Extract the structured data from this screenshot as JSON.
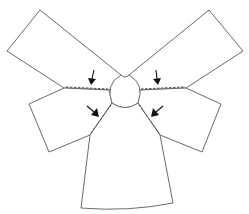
{
  "diagram": {
    "title": "",
    "pieces": [
      {
        "id": "top-left-panel",
        "label": ""
      },
      {
        "id": "top-right-panel",
        "label": ""
      },
      {
        "id": "middle-left-panel",
        "label": ""
      },
      {
        "id": "middle-right-panel",
        "label": ""
      },
      {
        "id": "bottom-panel",
        "label": ""
      },
      {
        "id": "center-head-piece",
        "label": ""
      }
    ],
    "seams": [
      {
        "id": "seam-top-left",
        "style": "dashed"
      },
      {
        "id": "seam-top-right",
        "style": "dashed"
      },
      {
        "id": "seam-lower-left",
        "style": "dashed"
      },
      {
        "id": "seam-lower-right",
        "style": "dashed"
      }
    ],
    "arrows": [
      {
        "id": "arrow-top-left",
        "direction": "down",
        "points_to": "seam-top-left"
      },
      {
        "id": "arrow-top-right",
        "direction": "down",
        "points_to": "seam-top-right"
      },
      {
        "id": "arrow-lower-left",
        "direction": "down-right",
        "points_to": "seam-lower-left"
      },
      {
        "id": "arrow-lower-right",
        "direction": "down-left",
        "points_to": "seam-lower-right"
      }
    ],
    "colors": {
      "outline": "#6a6a6a",
      "seam": "#4a4a4a",
      "arrow": "#111111",
      "background": "#ffffff"
    }
  }
}
